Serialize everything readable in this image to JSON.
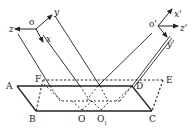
{
  "diagram": {
    "colors": {
      "stroke": "#222222",
      "background": "#ffffff"
    },
    "frames": [
      {
        "origin_label": "o",
        "axes": {
          "x": "x",
          "y": "y",
          "z": "z"
        }
      },
      {
        "origin_label": "o'",
        "axes": {
          "x": "x'",
          "y": "y'",
          "z": "z'"
        }
      }
    ],
    "points": {
      "A": "A",
      "B": "B",
      "C": "C",
      "D": "D",
      "E": "E",
      "F": "F",
      "O": "O",
      "O1": "O",
      "O1_sub": "1"
    }
  }
}
